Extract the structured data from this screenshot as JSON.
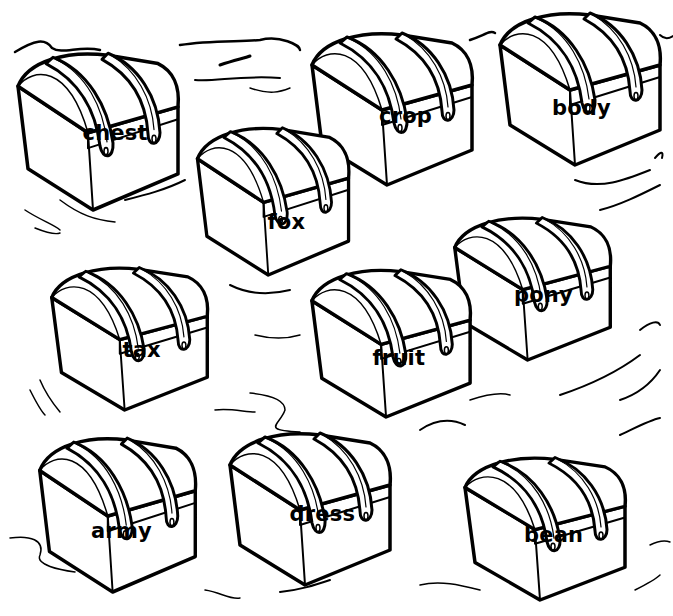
{
  "worksheet": {
    "title": "",
    "chests": [
      {
        "id": "chest",
        "word": "chest",
        "x": 8,
        "y": 45,
        "w": 180,
        "h": 165,
        "rot": 8,
        "lx": 115,
        "ly": 135
      },
      {
        "id": "crop",
        "word": "crop",
        "x": 302,
        "y": 25,
        "w": 180,
        "h": 160,
        "rot": 6,
        "lx": 405,
        "ly": 118
      },
      {
        "id": "body",
        "word": "body",
        "x": 490,
        "y": 5,
        "w": 180,
        "h": 160,
        "rot": 5,
        "lx": 578,
        "ly": 110
      },
      {
        "id": "fox",
        "word": "fox",
        "x": 188,
        "y": 120,
        "w": 170,
        "h": 155,
        "rot": 8,
        "lx": 287,
        "ly": 224
      },
      {
        "id": "pony",
        "word": "pony",
        "x": 445,
        "y": 210,
        "w": 175,
        "h": 150,
        "rot": 5,
        "lx": 540,
        "ly": 297
      },
      {
        "id": "tax",
        "word": "tax",
        "x": 42,
        "y": 260,
        "w": 175,
        "h": 150,
        "rot": 2,
        "lx": 142,
        "ly": 352
      },
      {
        "id": "fruit",
        "word": "fruit",
        "x": 302,
        "y": 262,
        "w": 178,
        "h": 155,
        "rot": 4,
        "lx": 405,
        "ly": 360
      },
      {
        "id": "army",
        "word": "army",
        "x": 30,
        "y": 430,
        "w": 175,
        "h": 162,
        "rot": 3,
        "lx": 117,
        "ly": 533
      },
      {
        "id": "dress",
        "word": "dress",
        "x": 220,
        "y": 425,
        "w": 180,
        "h": 160,
        "rot": 6,
        "lx": 322,
        "ly": 516
      },
      {
        "id": "bean",
        "word": "bean",
        "x": 455,
        "y": 450,
        "w": 180,
        "h": 150,
        "rot": 4,
        "lx": 550,
        "ly": 537
      }
    ]
  },
  "colors": {
    "ink": "#000000",
    "paper": "#ffffff"
  }
}
